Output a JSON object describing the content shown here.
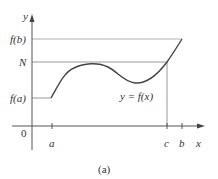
{
  "figure": {
    "caption": "(a)",
    "axes": {
      "x_label": "x",
      "y_label": "y",
      "origin_label": "0",
      "x_ticks": [
        "a",
        "c",
        "b"
      ],
      "y_ticks": [
        "f(b)",
        "N",
        "f(a)"
      ]
    },
    "curve_label": "y = f(x)",
    "colors": {
      "axis": "#555555",
      "curve": "#444444",
      "guide": "#b0b0b0",
      "text": "#333333"
    }
  }
}
